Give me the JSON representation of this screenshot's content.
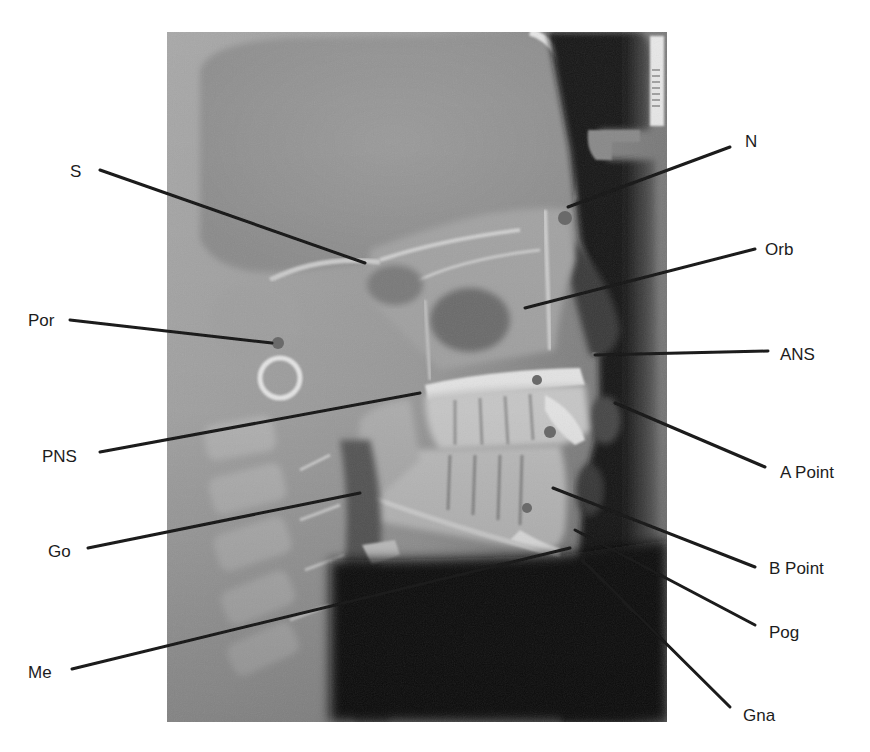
{
  "figure": {
    "type": "lateral cephalometric radiograph with landmark annotations",
    "colors": {
      "background": "#ffffff",
      "leader_line": "#1a1a1a",
      "label_text": "#1c1c1c",
      "landmark_dot": "#6a6a6a"
    }
  },
  "landmarks": [
    {
      "id": "S",
      "label": "S",
      "side": "left",
      "label_x": 70,
      "label_y": 163,
      "line": [
        100,
        170,
        365,
        263
      ]
    },
    {
      "id": "N",
      "label": "N",
      "side": "right",
      "label_x": 745,
      "label_y": 133,
      "line": [
        730,
        147,
        568,
        207
      ]
    },
    {
      "id": "Orb",
      "label": "Orb",
      "side": "right",
      "label_x": 765,
      "label_y": 241,
      "line": [
        755,
        249,
        525,
        308
      ]
    },
    {
      "id": "Por",
      "label": "Por",
      "side": "left",
      "label_x": 28,
      "label_y": 312,
      "line": [
        70,
        320,
        272,
        343
      ]
    },
    {
      "id": "ANS",
      "label": "ANS",
      "side": "right",
      "label_x": 780,
      "label_y": 346,
      "line": [
        768,
        351,
        595,
        355
      ]
    },
    {
      "id": "PNS",
      "label": "PNS",
      "side": "left",
      "label_x": 42,
      "label_y": 448,
      "line": [
        100,
        452,
        420,
        393
      ]
    },
    {
      "id": "A Point",
      "label": "A Point",
      "side": "right",
      "label_x": 780,
      "label_y": 464,
      "line": [
        765,
        467,
        615,
        403
      ]
    },
    {
      "id": "Go",
      "label": "Go",
      "side": "left",
      "label_x": 48,
      "label_y": 543,
      "line": [
        88,
        548,
        360,
        493
      ]
    },
    {
      "id": "B Point",
      "label": "B Point",
      "side": "right",
      "label_x": 769,
      "label_y": 560,
      "line": [
        755,
        567,
        553,
        488
      ]
    },
    {
      "id": "Pog",
      "label": "Pog",
      "side": "right",
      "label_x": 769,
      "label_y": 624,
      "line": [
        755,
        625,
        575,
        530
      ]
    },
    {
      "id": "Me",
      "label": "Me",
      "side": "left",
      "label_x": 28,
      "label_y": 664,
      "line": [
        72,
        669,
        570,
        548
      ]
    },
    {
      "id": "Gna",
      "label": "Gna",
      "side": "right",
      "label_x": 743,
      "label_y": 707,
      "line": [
        730,
        707,
        582,
        560
      ]
    }
  ],
  "landmark_dots": [
    {
      "name": "nasion-dot",
      "cx": 565,
      "cy": 218,
      "r": 7
    },
    {
      "name": "porion-dot",
      "cx": 278,
      "cy": 343,
      "r": 6
    },
    {
      "name": "ans-dot",
      "cx": 594,
      "cy": 355,
      "r": 3
    },
    {
      "name": "a-point-dot",
      "cx": 537,
      "cy": 380,
      "r": 5
    },
    {
      "name": "upper-incisor-dot",
      "cx": 550,
      "cy": 432,
      "r": 6
    },
    {
      "name": "b-point-dot",
      "cx": 527,
      "cy": 508,
      "r": 5
    }
  ],
  "radiograph": {
    "x": 167,
    "y": 32,
    "width": 500,
    "height": 690
  }
}
